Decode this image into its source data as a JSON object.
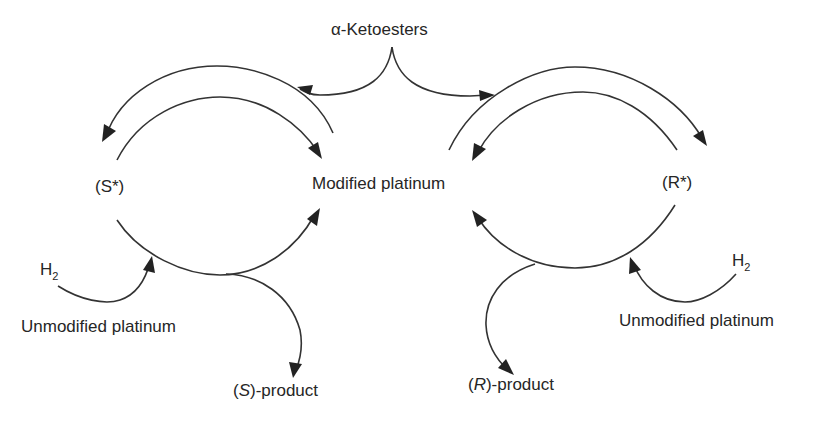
{
  "diagram": {
    "type": "catalytic cycle",
    "labels": {
      "ketoesters": "α-Ketoesters",
      "modified_platinum": "Modified platinum",
      "s_star": "(S*)",
      "r_star": "(R*)",
      "h2_left": "H",
      "h2_left_sub": "2",
      "h2_right": "H",
      "h2_right_sub": "2",
      "unmodified_left": "Unmodified platinum",
      "unmodified_right": "Unmodified platinum",
      "s_product_open": "(",
      "s_product_italic": "S",
      "s_product_rest": ")-product",
      "r_product_open": "(",
      "r_product_italic": "R",
      "r_product_rest": ")-product"
    },
    "nodes": [
      "α-Ketoesters",
      "Modified platinum",
      "(S*)",
      "(R*)",
      "H2",
      "Unmodified platinum",
      "(S)-product",
      "(R)-product"
    ],
    "edges": [
      {
        "from": "α-Ketoesters",
        "to": "(S*) cycle"
      },
      {
        "from": "α-Ketoesters",
        "to": "(R*) cycle"
      },
      {
        "from": "Modified platinum",
        "to": "(S*)"
      },
      {
        "from": "(S*)",
        "to": "Modified platinum"
      },
      {
        "from": "Modified platinum",
        "to": "(R*)"
      },
      {
        "from": "(R*)",
        "to": "Modified platinum"
      },
      {
        "from": "H2 / Unmodified platinum",
        "to": "(S*) cycle"
      },
      {
        "from": "H2 / Unmodified platinum",
        "to": "(R*) cycle"
      },
      {
        "from": "(S*) cycle",
        "to": "(S)-product"
      },
      {
        "from": "(R*) cycle",
        "to": "(R)-product"
      }
    ]
  }
}
